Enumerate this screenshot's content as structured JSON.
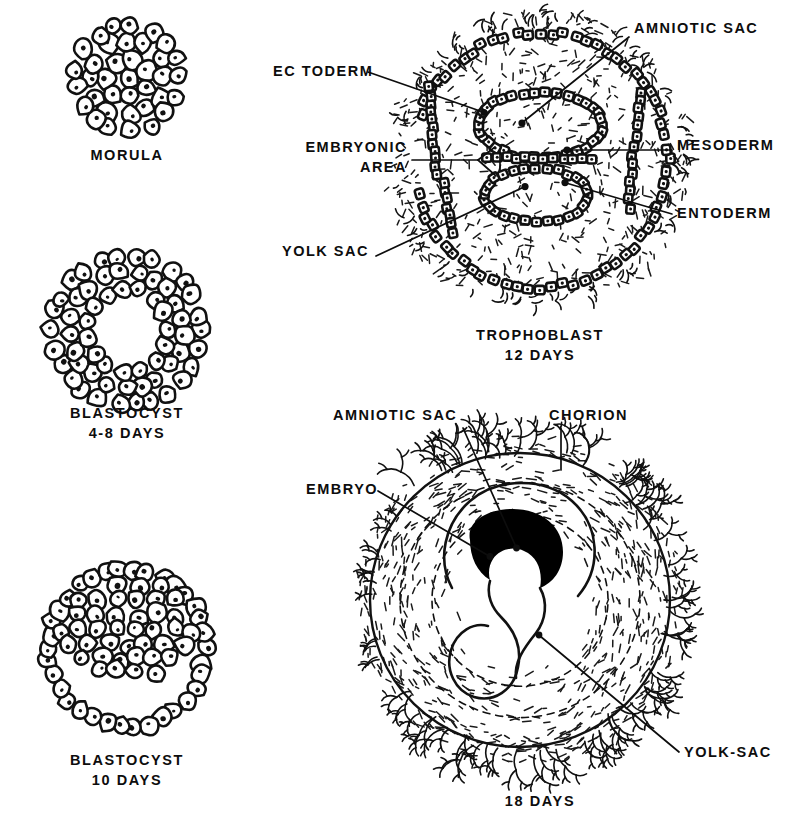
{
  "figure": {
    "background_color": "#ffffff",
    "ink_color": "#111111"
  },
  "panels": [
    {
      "id": "morula",
      "caption_lines": [
        "MORULA"
      ],
      "caption_x": 127,
      "caption_y": 160,
      "description": "solid ball of cells"
    },
    {
      "id": "blastocyst-4-8",
      "caption_lines": [
        "BLASTOCYST",
        "4-8 DAYS"
      ],
      "caption_x": 127,
      "caption_y": 418,
      "description": "ring of cells with central cavity"
    },
    {
      "id": "blastocyst-10",
      "caption_lines": [
        "BLASTOCYST",
        "10 DAYS"
      ],
      "caption_x": 127,
      "caption_y": 765,
      "description": "thin outer ring with inner cell mass at top"
    },
    {
      "id": "trophoblast-12",
      "caption_lines": [
        "TROPHOBLAST",
        "12 DAYS"
      ],
      "caption_x": 540,
      "caption_y": 340,
      "description": "implanted blastocyst with amniotic sac and yolk sac"
    },
    {
      "id": "eighteen-days",
      "caption_lines": [
        "18 DAYS"
      ],
      "caption_x": 540,
      "caption_y": 806,
      "description": "embryo within chorion with villi"
    }
  ],
  "labels": {
    "trophoblast_panel": [
      {
        "id": "amniotic-sac",
        "text": "AMNIOTIC SAC",
        "x": 634,
        "y": 33,
        "anchor": "start"
      },
      {
        "id": "ectoderm",
        "text": "EC TODERM",
        "x": 273,
        "y": 76,
        "anchor": "start"
      },
      {
        "id": "embryonic-area",
        "text": "EMBRYONIC",
        "x": 407,
        "y": 152,
        "anchor": "end"
      },
      {
        "id": "embryonic-area2",
        "text": "AREA",
        "x": 407,
        "y": 172,
        "anchor": "end"
      },
      {
        "id": "mesoderm",
        "text": "MESODERM",
        "x": 677,
        "y": 150,
        "anchor": "start"
      },
      {
        "id": "entoderm",
        "text": "ENTODERM",
        "x": 677,
        "y": 218,
        "anchor": "start"
      },
      {
        "id": "yolk-sac",
        "text": "YOLK SAC",
        "x": 282,
        "y": 256,
        "anchor": "start"
      }
    ],
    "eighteen_days_panel": [
      {
        "id": "amniotic-sac-18",
        "text": "AMNIOTIC  SAC",
        "x": 333,
        "y": 420,
        "anchor": "start"
      },
      {
        "id": "chorion",
        "text": "CHORION",
        "x": 549,
        "y": 420,
        "anchor": "start"
      },
      {
        "id": "embryo",
        "text": "EMBRYO",
        "x": 306,
        "y": 494,
        "anchor": "start"
      },
      {
        "id": "yolk-sac-18",
        "text": "YOLK-SAC",
        "x": 684,
        "y": 757,
        "anchor": "start"
      }
    ]
  }
}
